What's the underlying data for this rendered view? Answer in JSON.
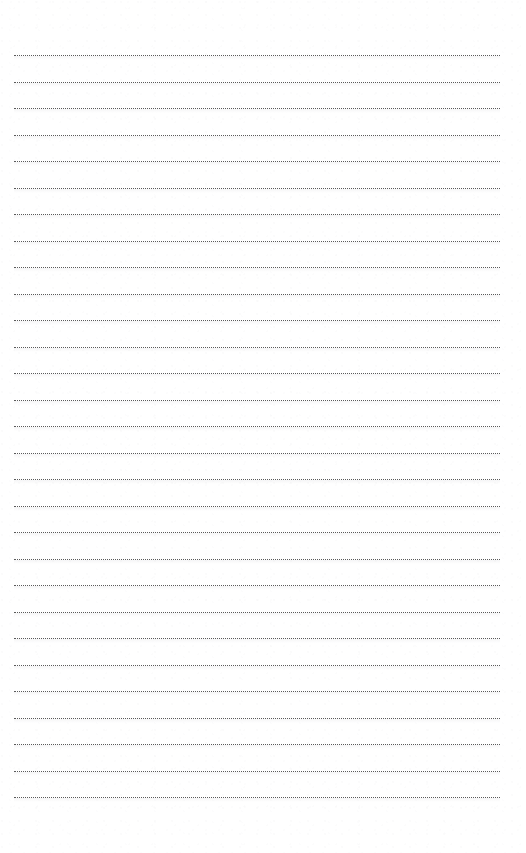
{
  "page": {
    "kind": "lined-paper-sheet",
    "width_px": 526,
    "height_px": 853,
    "background_color": "#ffffff",
    "content_text": ""
  },
  "rules": {
    "style": "dotted",
    "color": "#5a5a5a",
    "thickness_px": 1,
    "count": 29,
    "left_margin_px": 14,
    "right_margin_px": 26,
    "line_length_px": 486,
    "first_line_y_px": 55,
    "line_spacing_px": 26.5,
    "last_line_y_px": 809,
    "top_margin_px": 55,
    "bottom_margin_px": 44,
    "y_positions": [
      55,
      81.5,
      108,
      134.5,
      161,
      187.5,
      214,
      240.5,
      267,
      293.5,
      320,
      346.5,
      373,
      399.5,
      426,
      452.5,
      479,
      505.5,
      532,
      558.5,
      585,
      611.5,
      638,
      664.5,
      691,
      717.5,
      744,
      770.5,
      797
    ]
  }
}
